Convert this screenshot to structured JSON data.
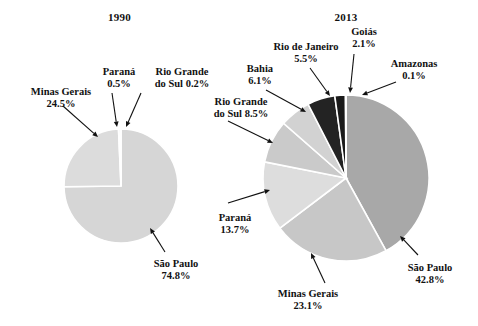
{
  "figure": {
    "type": "pie-pair",
    "background": "#ffffff",
    "text_color": "#111111",
    "slice_border": "#ffffff"
  },
  "charts": [
    {
      "id": "chart-1990",
      "title": "1990",
      "center": {
        "x": 121,
        "y": 186
      },
      "radius": 57,
      "start_angle_deg": -90,
      "slices": [
        {
          "label": "São Paulo",
          "value": 74.8,
          "percent_text": "74.8%",
          "color": "#d6d6d6"
        },
        {
          "label": "Minas Gerais",
          "value": 24.5,
          "percent_text": "24.5%",
          "color": "#dcdcdc"
        },
        {
          "label": "Paraná",
          "value": 0.5,
          "percent_text": "0.5%",
          "color": "#d0d0d0"
        },
        {
          "label": "Rio Grande do Sul",
          "value": 0.2,
          "percent_text": "0.2%",
          "color": "#c9c9c9"
        }
      ],
      "labels": [
        {
          "name": "minas-gerais",
          "line1": "Minas Gerais",
          "line2": "24.5%",
          "x": 14,
          "y": 86,
          "w": 94
        },
        {
          "name": "parana",
          "line1": "Paraná",
          "line2": "0.5%",
          "x": 95,
          "y": 66,
          "w": 48
        },
        {
          "name": "rio-grande-do-sul",
          "line1": "Rio Grande",
          "line2": "do Sul 0.2%",
          "x": 140,
          "y": 66,
          "w": 84
        },
        {
          "name": "sao-paulo",
          "line1": "São Paulo",
          "line2": "74.8%",
          "x": 136,
          "y": 258,
          "w": 80
        }
      ]
    },
    {
      "id": "chart-2013",
      "title": "2013",
      "center": {
        "x": 346,
        "y": 178
      },
      "radius": 83,
      "start_angle_deg": -90,
      "slices": [
        {
          "label": "São Paulo",
          "value": 42.8,
          "percent_text": "42.8%",
          "color": "#a8a8a8"
        },
        {
          "label": "Minas Gerais",
          "value": 23.1,
          "percent_text": "23.1%",
          "color": "#c7c7c7"
        },
        {
          "label": "Paraná",
          "value": 13.7,
          "percent_text": "13.7%",
          "color": "#dddddd"
        },
        {
          "label": "Rio Grande do Sul",
          "value": 8.5,
          "percent_text": "8.5%",
          "color": "#cacaca"
        },
        {
          "label": "Bahia",
          "value": 6.1,
          "percent_text": "6.1%",
          "color": "#d2d2d2"
        },
        {
          "label": "Rio de Janeiro",
          "value": 5.5,
          "percent_text": "5.5%",
          "color": "#232323"
        },
        {
          "label": "Goiás",
          "value": 2.1,
          "percent_text": "2.1%",
          "color": "#1a1a1a"
        },
        {
          "label": "Amazonas",
          "value": 0.1,
          "percent_text": "0.1%",
          "color": "#4a4a4a"
        }
      ],
      "labels": [
        {
          "name": "rio-grande-do-sul",
          "line1": "Rio Grande",
          "line2": "do Sul 8.5%",
          "x": 197,
          "y": 96,
          "w": 88
        },
        {
          "name": "bahia",
          "line1": "Bahia",
          "line2": "6.1%",
          "x": 234,
          "y": 63,
          "w": 52
        },
        {
          "name": "rio-de-janeiro",
          "line1": "Rio de Janeiro",
          "line2": "5.5%",
          "x": 258,
          "y": 41,
          "w": 96
        },
        {
          "name": "goias",
          "line1": "Goiás",
          "line2": "2.1%",
          "x": 340,
          "y": 26,
          "w": 48
        },
        {
          "name": "amazonas",
          "line1": "Amazonas",
          "line2": "0.1%",
          "x": 376,
          "y": 58,
          "w": 76
        },
        {
          "name": "sao-paulo",
          "line1": "São Paulo",
          "line2": "42.8%",
          "x": 392,
          "y": 262,
          "w": 76
        },
        {
          "name": "minas-gerais",
          "line1": "Minas Gerais",
          "line2": "23.1%",
          "x": 265,
          "y": 288,
          "w": 86
        },
        {
          "name": "parana",
          "line1": "Paraná",
          "line2": "13.7%",
          "x": 210,
          "y": 212,
          "w": 50
        }
      ]
    }
  ],
  "leaders": [
    {
      "name": "leader-minas-gerais-1990",
      "x1": 63,
      "y1": 106,
      "x2": 98,
      "y2": 137
    },
    {
      "name": "leader-parana-1990",
      "x1": 112,
      "y1": 93,
      "x2": 117,
      "y2": 127
    },
    {
      "name": "leader-rio-grande-do-sul-1990",
      "x1": 141,
      "y1": 93,
      "x2": 126,
      "y2": 127
    },
    {
      "name": "leader-sao-paulo-1990",
      "x1": 165,
      "y1": 252,
      "x2": 150,
      "y2": 228
    },
    {
      "name": "leader-rio-grande-do-sul-2013",
      "x1": 228,
      "y1": 121,
      "x2": 273,
      "y2": 143
    },
    {
      "name": "leader-bahia-2013",
      "x1": 266,
      "y1": 90,
      "x2": 306,
      "y2": 112
    },
    {
      "name": "leader-rio-de-janeiro-2013",
      "x1": 310,
      "y1": 68,
      "x2": 330,
      "y2": 96
    },
    {
      "name": "leader-goias-2013",
      "x1": 354,
      "y1": 54,
      "x2": 350,
      "y2": 93
    },
    {
      "name": "leader-amazonas-2013",
      "x1": 396,
      "y1": 82,
      "x2": 362,
      "y2": 95
    },
    {
      "name": "leader-sao-paulo-2013",
      "x1": 418,
      "y1": 255,
      "x2": 400,
      "y2": 236
    },
    {
      "name": "leader-minas-gerais-2013",
      "x1": 325,
      "y1": 283,
      "x2": 311,
      "y2": 253
    },
    {
      "name": "leader-parana-2013",
      "x1": 228,
      "y1": 203,
      "x2": 270,
      "y2": 190
    }
  ],
  "chart_data": {
    "type": "pie",
    "panels": [
      {
        "title": "1990",
        "categories": [
          "São Paulo",
          "Minas Gerais",
          "Paraná",
          "Rio Grande do Sul"
        ],
        "values": [
          74.8,
          24.5,
          0.5,
          0.2
        ],
        "unit": "%"
      },
      {
        "title": "2013",
        "categories": [
          "São Paulo",
          "Minas Gerais",
          "Paraná",
          "Rio Grande do Sul",
          "Bahia",
          "Rio de Janeiro",
          "Goiás",
          "Amazonas"
        ],
        "values": [
          42.8,
          23.1,
          13.7,
          8.5,
          6.1,
          5.5,
          2.1,
          0.1
        ],
        "unit": "%"
      }
    ],
    "legend": "none",
    "grid": false,
    "labels_position": "outside-with-leader-lines"
  }
}
